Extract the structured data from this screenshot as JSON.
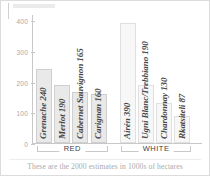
{
  "chart_data": {
    "type": "bar",
    "title": "",
    "xlabel": "",
    "ylabel": "",
    "ylim": [
      0,
      420
    ],
    "yticks": [
      0,
      100,
      200,
      300,
      400
    ],
    "ytick_labels": [
      "0",
      "100",
      "200",
      "300",
      "400"
    ],
    "grid": false,
    "legend": "none",
    "units_note": "These are the 2000 estimates in 1000s of hectares",
    "categories": [
      "Grenache",
      "Merlot",
      "Cabernet Sauvignon",
      "Carignan",
      "Airén",
      "Ugni Blanc/Trebbiano",
      "Chardonnay",
      "Rkatsiteli"
    ],
    "values": [
      240,
      190,
      165,
      160,
      390,
      190,
      130,
      87
    ],
    "bars": [
      {
        "label": "Grenache 240",
        "name": "Grenache",
        "value": 240,
        "group": "RED",
        "shade": "normal"
      },
      {
        "label": "Merlot 190",
        "name": "Merlot",
        "value": 190,
        "group": "RED",
        "shade": "normal"
      },
      {
        "label": "Cabernet Sauvignon 165",
        "name": "Cabernet Sauvignon",
        "value": 165,
        "group": "RED",
        "shade": "normal"
      },
      {
        "label": "Carignan 160",
        "name": "Carignan",
        "value": 160,
        "group": "RED",
        "shade": "normal"
      },
      {
        "label": "Airén 390",
        "name": "Airén",
        "value": 390,
        "group": "WHITE",
        "shade": "pale"
      },
      {
        "label": "Ugni Blanc/Trebbiano 190",
        "name": "Ugni Blanc/Trebbiano",
        "value": 190,
        "group": "WHITE",
        "shade": "pale"
      },
      {
        "label": "Chardonnay 130",
        "name": "Chardonnay",
        "value": 130,
        "group": "WHITE",
        "shade": "pale"
      },
      {
        "label": "Rkatsiteli 87",
        "name": "Rkatsiteli",
        "value": 87,
        "group": "WHITE",
        "shade": "pale"
      }
    ],
    "groups": [
      {
        "label": "RED",
        "bar_start": 0,
        "bar_end": 3
      },
      {
        "label": "WHITE",
        "bar_start": 4,
        "bar_end": 7
      }
    ],
    "colors": {
      "bar_fill": "#e9e9e9",
      "bar_stroke": "#cfcfcf",
      "bar_fill_pale": "#f7f7f7",
      "bar_stroke_pale": "#e0e0e0",
      "axis": "#c8c8c8",
      "tick_label": "#a8a8a8",
      "bar_label": "#474747",
      "footnote": "#aaaaaa",
      "card_border": "#dcdcdc",
      "background": "#ffffff"
    }
  }
}
